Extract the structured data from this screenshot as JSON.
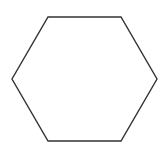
{
  "diagram": {
    "shape": "hexagon",
    "orientation": "flat-top",
    "points": [
      [
        48,
        17
      ],
      [
        121,
        17
      ],
      [
        157,
        79
      ],
      [
        121,
        141
      ],
      [
        48,
        141
      ],
      [
        12,
        79
      ]
    ],
    "stroke": "#333333",
    "stroke_width": 1.4,
    "fill": "#ffffff",
    "background": "#ffffff"
  }
}
